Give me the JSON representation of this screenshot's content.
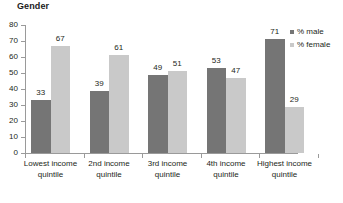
{
  "chart_data": {
    "type": "bar",
    "title": "Gender",
    "xlabel": "",
    "ylabel": "",
    "ylim": [
      0,
      80
    ],
    "yticks": [
      0,
      10,
      20,
      30,
      40,
      50,
      60,
      70,
      80
    ],
    "ytick_labels": [
      "0",
      "10",
      "20",
      "30",
      "40",
      "50",
      "60",
      "70",
      "80"
    ],
    "grid": false,
    "legend_position": "right",
    "categories": [
      "Lowest income quintile",
      "2nd income quintile",
      "3rd income quintile",
      "4th income quintile",
      "Highest income quintile"
    ],
    "series": [
      {
        "name": "% male",
        "color": "#757575",
        "values": [
          33,
          39,
          49,
          53,
          71
        ],
        "labels": [
          "33",
          "39",
          "49",
          "53",
          "71"
        ]
      },
      {
        "name": "% female",
        "color": "#c9c9c9",
        "values": [
          67,
          61,
          51,
          47,
          29
        ],
        "labels": [
          "67",
          "61",
          "51",
          "47",
          "29"
        ]
      }
    ]
  },
  "legend": {
    "items": [
      {
        "label": "% male",
        "color": "#757575"
      },
      {
        "label": "% female",
        "color": "#c9c9c9"
      }
    ]
  },
  "axis": {
    "y_labels": [
      "80",
      "70",
      "60",
      "50",
      "40",
      "30",
      "20",
      "10",
      "0"
    ]
  },
  "category_labels": [
    "Lowest income quintile",
    "2nd income quintile",
    "3rd income quintile",
    "4th income quintile",
    "Highest income quintile"
  ],
  "bar_labels": {
    "male": [
      "33",
      "39",
      "49",
      "53",
      "71"
    ],
    "female": [
      "67",
      "61",
      "51",
      "47",
      "29"
    ]
  },
  "colors": {
    "male": "#757575",
    "female": "#c9c9c9",
    "axis": "#9a9a9a",
    "text": "#231f20",
    "background": "#ffffff"
  }
}
